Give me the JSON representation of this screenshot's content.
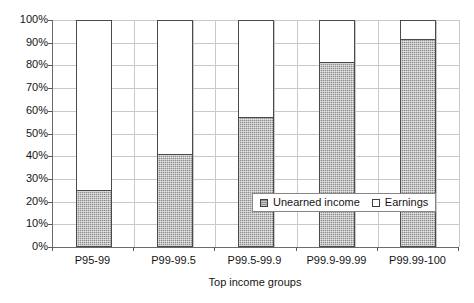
{
  "chart_data": {
    "type": "bar",
    "subtype": "stacked-100-percent",
    "title": "",
    "xlabel": "Top income groups",
    "ylabel": "",
    "categories": [
      "P95-99",
      "P99-99.5",
      "P99.5-99.9",
      "P99.9-99.99",
      "P99.99-100"
    ],
    "series": [
      {
        "name": "Unearned income",
        "values": [
          24.5,
          40.5,
          57.0,
          81.0,
          91.0
        ],
        "color": "#8d8d8d"
      },
      {
        "name": "Earnings",
        "values": [
          75.5,
          59.5,
          43.0,
          19.0,
          9.0
        ],
        "color": "#ffffff"
      }
    ],
    "ylim": [
      0,
      100
    ],
    "y_ticks": [
      0,
      10,
      20,
      30,
      40,
      50,
      60,
      70,
      80,
      90,
      100
    ],
    "y_tick_labels": [
      "0%",
      "10%",
      "20%",
      "30%",
      "40%",
      "50%",
      "60%",
      "70%",
      "80%",
      "90%",
      "100%"
    ],
    "grid": "horizontal-and-vertical",
    "legend_position": "inside-lower-right",
    "legend_entries": [
      "Unearned income",
      "Earnings"
    ]
  },
  "axes": {
    "x_title": "Top income groups",
    "x_tick_labels": [
      "P95-99",
      "P99-99.5",
      "P99.5-99.9",
      "P99.9-99.99",
      "P99.99-100"
    ],
    "y_tick_labels": [
      "100%",
      "90%",
      "80%",
      "70%",
      "60%",
      "50%",
      "40%",
      "30%",
      "20%",
      "10%",
      "0%"
    ]
  },
  "legend": {
    "items": [
      {
        "label": "Unearned income",
        "swatch": "filled"
      },
      {
        "label": "Earnings",
        "swatch": "hollow"
      }
    ]
  },
  "colors": {
    "unearned_fill": "#8d8d8d",
    "earnings_fill": "#ffffff",
    "bar_outline": "#4a4a4a",
    "gridline": "#c9c9c9",
    "axis": "#6b6b6b",
    "text": "#141414"
  }
}
